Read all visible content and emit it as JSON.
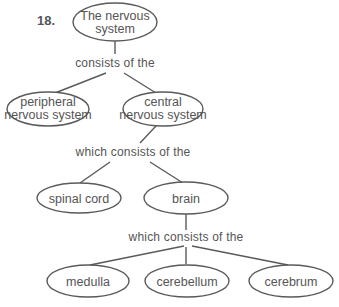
{
  "problem_number": "18.",
  "nodes": {
    "root": {
      "line1": "The nervous",
      "line2": "system"
    },
    "peripheral": {
      "line1": "peripheral",
      "line2": "nervous system"
    },
    "central": {
      "line1": "central",
      "line2": "nervous system"
    },
    "spinal_cord": {
      "label": "spinal cord"
    },
    "brain": {
      "label": "brain"
    },
    "medulla": {
      "label": "medulla"
    },
    "cerebellum": {
      "label": "cerebellum"
    },
    "cerebrum": {
      "label": "cerebrum"
    }
  },
  "links": {
    "root_link": "consists of the",
    "central_link": "which consists of the",
    "brain_link": "which consists of the"
  },
  "colors": {
    "stroke": "#5a5a5a",
    "text": "#555555",
    "background": "#ffffff"
  }
}
